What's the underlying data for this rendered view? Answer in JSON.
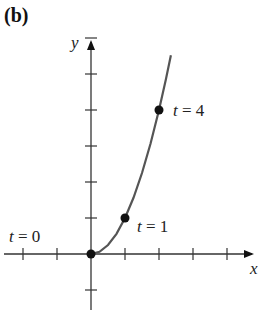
{
  "figure": {
    "panel_label": "(b)",
    "x_axis_label": "x",
    "y_axis_label": "y"
  },
  "chart_data": {
    "type": "line",
    "title": "",
    "panel_label": "(b)",
    "xlabel": "x",
    "ylabel": "y",
    "x_ticks": [
      -2,
      -1,
      0,
      1,
      2,
      3,
      4
    ],
    "y_ticks": [
      -1,
      0,
      1,
      2,
      3,
      4,
      5,
      6
    ],
    "xlim": [
      -2.6,
      5.0
    ],
    "ylim": [
      -1.6,
      6.3
    ],
    "tick_labels_shown": false,
    "grid": false,
    "series": [
      {
        "name": "curve",
        "color": "#555555",
        "x": [
          0,
          0.25,
          0.5,
          0.75,
          1.0,
          1.25,
          1.5,
          1.75,
          2.0,
          2.2,
          2.35
        ],
        "y": [
          0,
          0.0625,
          0.25,
          0.5625,
          1.0,
          1.5625,
          2.25,
          3.0625,
          4.0,
          4.84,
          5.52
        ]
      }
    ],
    "points": [
      {
        "label": "t = 0",
        "t": 0,
        "x": 0,
        "y": 0
      },
      {
        "label": "t = 1",
        "t": 1,
        "x": 1,
        "y": 1
      },
      {
        "label": "t = 4",
        "t": 4,
        "x": 2,
        "y": 4
      }
    ],
    "annotations": [
      {
        "text": "t = 0",
        "near": [
          0,
          0
        ],
        "position": "upper-left"
      },
      {
        "text": "t = 1",
        "near": [
          1,
          1
        ],
        "position": "lower-right"
      },
      {
        "text": "t = 4",
        "near": [
          2,
          4
        ],
        "position": "right"
      }
    ]
  }
}
